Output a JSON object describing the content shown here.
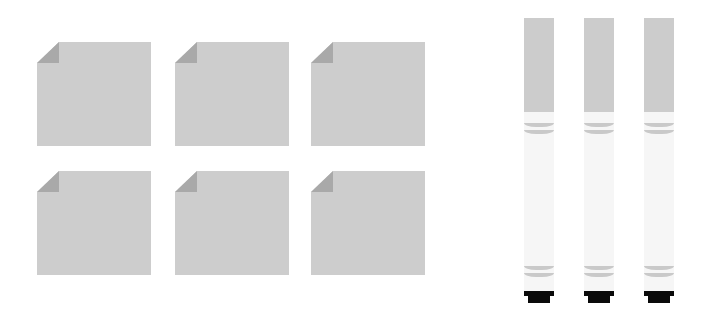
{
  "colors": {
    "background": "#ffffff",
    "tile": "#cdcdcd",
    "tile_fold": "#a9a9a9",
    "marker_cap": "#cccccc",
    "marker_body": "#f6f6f6",
    "marker_band": "#c9c9c9",
    "marker_tip": "#0a0a0a"
  },
  "tiles": [
    {
      "row": 1,
      "col": 1,
      "icon": "folded-note-icon"
    },
    {
      "row": 1,
      "col": 2,
      "icon": "folded-note-icon"
    },
    {
      "row": 1,
      "col": 3,
      "icon": "folded-note-icon"
    },
    {
      "row": 2,
      "col": 1,
      "icon": "folded-note-icon"
    },
    {
      "row": 2,
      "col": 2,
      "icon": "folded-note-icon"
    },
    {
      "row": 2,
      "col": 3,
      "icon": "folded-note-icon"
    }
  ],
  "markers": [
    {
      "index": 1,
      "icon": "marker-icon"
    },
    {
      "index": 2,
      "icon": "marker-icon"
    },
    {
      "index": 3,
      "icon": "marker-icon"
    }
  ]
}
